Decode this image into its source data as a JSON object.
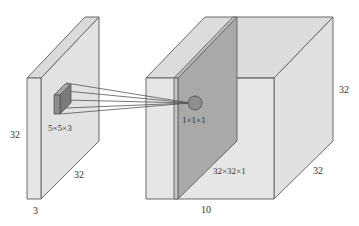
{
  "diagram": {
    "type": "convolution-1x1-illustration",
    "colors": {
      "face_light": "#e4e4e4",
      "face_top": "#dcdcdc",
      "face_side": "#d6d6d6",
      "slice_dark": "#a9a9a9",
      "slice_edge": "#8e8e8e",
      "filter_front": "#8a8a8a",
      "filter_top": "#a0a0a0",
      "filter_side": "#6e6e6e",
      "stroke": "#6a6a6a",
      "text": "#333333"
    },
    "input_volume": {
      "height_label": "32",
      "width_label": "32",
      "depth_label": "3"
    },
    "filter": {
      "label": "5×5×3"
    },
    "output_point": {
      "label": "1×1×1"
    },
    "output_volume": {
      "height_label": "32",
      "width_label": "32",
      "depth_label": "10",
      "slice_label": "32×32×1"
    }
  }
}
